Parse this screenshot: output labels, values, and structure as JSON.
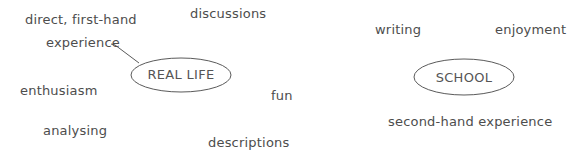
{
  "diagram": {
    "type": "mind-map",
    "stroke_color": "#555555",
    "text_color": "#4d4d4d",
    "clusters": [
      {
        "center": "REAL LIFE",
        "words": [
          "direct, first-hand",
          "experience",
          "discussions",
          "enthusiasm",
          "fun",
          "analysing",
          "descriptions"
        ],
        "connected_word": "direct, first-hand experience"
      },
      {
        "center": "SCHOOL",
        "words": [
          "writing",
          "enjoyment",
          "second-hand experience"
        ]
      }
    ]
  }
}
